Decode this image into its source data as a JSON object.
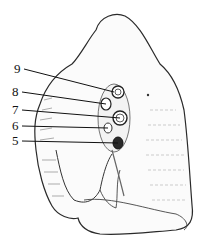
{
  "figure": {
    "labels": [
      {
        "text": "9",
        "x": 14,
        "y": 64,
        "tx": 114,
        "ty": 92
      },
      {
        "text": "8",
        "x": 12,
        "y": 87,
        "tx": 106,
        "ty": 104
      },
      {
        "text": "7",
        "x": 12,
        "y": 105,
        "tx": 120,
        "ty": 118
      },
      {
        "text": "6",
        "x": 12,
        "y": 121,
        "tx": 108,
        "ty": 128
      },
      {
        "text": "5",
        "x": 12,
        "y": 136,
        "tx": 118,
        "ty": 143
      }
    ],
    "colors": {
      "ink": "#1a1a1a",
      "shade": "#6b6b6b",
      "paper": "#ffffff"
    }
  }
}
